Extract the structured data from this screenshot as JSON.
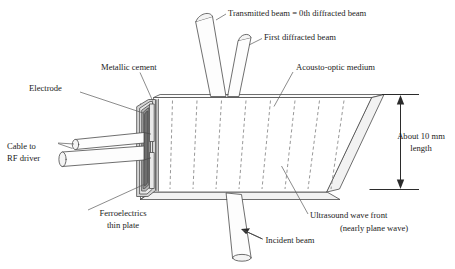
{
  "figure": {
    "name": "acousto-optic-modulator-diagram",
    "labels": {
      "transmitted_beam": "Transmitted beam = 0th diffracted beam",
      "first_diffracted_beam": "First diffracted beam",
      "metallic_cement": "Metallic cement",
      "electrode": "Electrode",
      "cable_line1": "Cable to",
      "cable_line2": "RF driver",
      "ferroelectrics_line1": "Ferroelectrics",
      "ferroelectrics_line2": "thin plate",
      "acousto_optic_medium": "Acousto-optic medium",
      "dimension_line1": "About 10 mm",
      "dimension_line2": "length",
      "ultrasound_line1": "Ultrasound wave front",
      "ultrasound_line2": "(nearly plane wave)",
      "incident_beam": "Incident beam"
    },
    "colors": {
      "outline": "#4a4a4a",
      "wavefront": "#8c8c8c",
      "dimension": "#2b2b2b",
      "text": "#1b1b1b",
      "background": "#ffffff"
    },
    "wavefront_count": 8,
    "dimension_value": "About 10 mm"
  }
}
